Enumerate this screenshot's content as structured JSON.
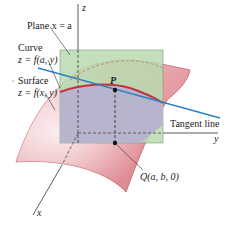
{
  "diagram": {
    "axes": {
      "z_label": "z",
      "y_label": "y",
      "x_label": "x"
    },
    "labels": {
      "plane": "Plane x = a",
      "curve_line1": "Curve",
      "curve_line2": "z = f(a, y)",
      "surface_line1": "Surface",
      "surface_line2": "z = f(x, y)",
      "point_p": "P",
      "tangent": "Tangent line",
      "point_q": "Q(a, b, 0)"
    },
    "colors": {
      "plane_fill": "#b9d9b0",
      "surface_fill": "#e9a9ae",
      "surface_edge": "#c0606a",
      "curve": "#c0323f",
      "tangent": "#2f7fc1",
      "region_fill": "#b6b2cf",
      "axis": "#333333"
    }
  }
}
